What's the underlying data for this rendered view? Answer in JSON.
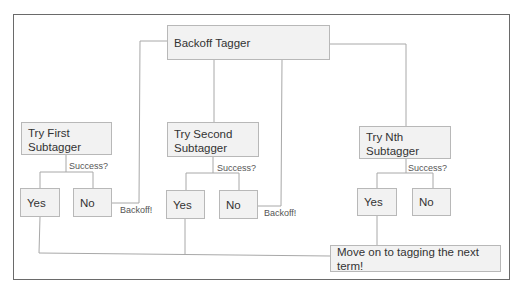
{
  "diagram": {
    "title_node": {
      "label": "Backoff Tagger"
    },
    "subtaggers": [
      {
        "label_line1": "Try First",
        "label_line2": "Subtagger",
        "question": "Success?",
        "yes": "Yes",
        "no": "No",
        "fallback": "Backoff!"
      },
      {
        "label_line1": "Try Second",
        "label_line2": "Subtagger",
        "question": "Success?",
        "yes": "Yes",
        "no": "No",
        "fallback": "Backoff!"
      },
      {
        "label_line1": "Try Nth",
        "label_line2": "Subtagger",
        "question": "Success?",
        "yes": "Yes",
        "no": "No"
      }
    ],
    "final_node": {
      "label": "Move on to tagging the next term!"
    }
  },
  "colors": {
    "box_fill": "#f2f2f2",
    "box_border": "#b8b8b8",
    "line": "#a8a8a8",
    "frame": "#6a6a6a"
  }
}
